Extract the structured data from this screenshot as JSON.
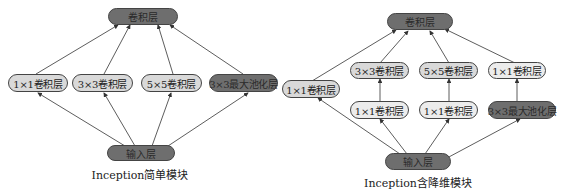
{
  "left_module": {
    "caption": "Inception简单模块",
    "output_node": "卷积层",
    "input_node": "输入层",
    "branches": [
      "1×1卷积层",
      "3×3卷积层",
      "5×5卷积层",
      "3×3最大池化层"
    ]
  },
  "right_module": {
    "caption": "Inception含降维模块",
    "output_node": "卷积层",
    "input_node": "输入层",
    "branch1": "1×1卷积层",
    "upper_row": [
      "3×3卷积层",
      "5×5卷积层",
      "1×1卷积层"
    ],
    "lower_row": [
      "1×1卷积层",
      "1×1卷积层",
      "3×3最大池化层"
    ]
  },
  "colors": {
    "dark_node": "#6e6e6e",
    "light_node": "#d9d9d9",
    "pale_node": "#ececec",
    "edge": "#333333"
  }
}
